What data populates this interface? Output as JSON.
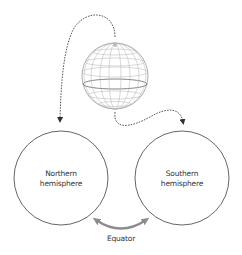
{
  "diagram": {
    "globe": {
      "label": ""
    },
    "nodes": [
      {
        "id": "northern",
        "label_line1": "Northern",
        "label_line2": "hemisphere"
      },
      {
        "id": "southern",
        "label_line1": "Southern",
        "label_line2": "hemisphere"
      }
    ],
    "connector": {
      "label": "Equator"
    },
    "colors": {
      "outline": "#555555",
      "dashed_arrow": "#444444",
      "globe_grid": "#9a9a9a",
      "equator_arrow": "#8c8c8c",
      "text": "#333333"
    }
  }
}
